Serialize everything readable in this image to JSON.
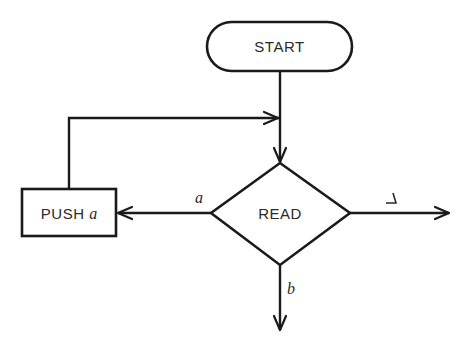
{
  "diagram": {
    "type": "flowchart",
    "nodes": {
      "start": {
        "label": "START",
        "shape": "terminator"
      },
      "read": {
        "label": "READ",
        "shape": "decision"
      },
      "push": {
        "label": "PUSH ",
        "label_var": "a",
        "shape": "process"
      }
    },
    "edges": {
      "start_to_read": {
        "from": "START",
        "to": "READ",
        "label": ""
      },
      "loop_to_read": {
        "from": "PUSH a",
        "to": "READ",
        "label": ""
      },
      "read_to_push": {
        "from": "READ",
        "to": "PUSH a",
        "label": "a"
      },
      "read_to_right": {
        "from": "READ",
        "to": "exit-right",
        "label": "blank",
        "label_glyph": "blank-symbol"
      },
      "read_to_bottom": {
        "from": "READ",
        "to": "exit-bottom",
        "label": "b"
      }
    },
    "colors": {
      "line": "#1a1a1a",
      "text": "#2a2a2a",
      "background": "#ffffff"
    }
  }
}
